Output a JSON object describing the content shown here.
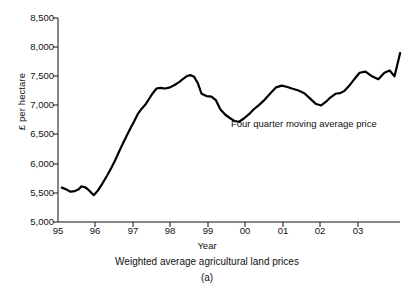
{
  "chart_data": {
    "type": "line",
    "title": "",
    "caption": "Weighted average agricultural land prices",
    "sub_caption": "(a)",
    "xlabel": "Year",
    "ylabel": "£ per hectare",
    "ylim": [
      5000,
      8500
    ],
    "ytick_values": [
      8500,
      8000,
      7500,
      7000,
      6500,
      6000,
      5500,
      5000
    ],
    "ytick_labels": [
      "8,500",
      "8,000",
      "7,500",
      "7,000",
      "6,500",
      "6,000",
      "5,500",
      "5,000"
    ],
    "xlim": [
      1995.0,
      1995.0
    ],
    "xtick_values": [
      1995,
      1996,
      1997,
      1998,
      1999,
      2000,
      2001,
      2002,
      2003
    ],
    "xtick_labels": [
      "95",
      "96",
      "97",
      "98",
      "99",
      "00",
      "01",
      "02",
      "03"
    ],
    "grid": false,
    "legend_position": "inline-annotation",
    "series": [
      {
        "name": "Four quarter moving average price",
        "color": "#000000",
        "line_width": 2.2,
        "annotation": "Four quarter moving average price",
        "x": [
          1995.1,
          1995.22,
          1995.33,
          1995.45,
          1995.55,
          1995.62,
          1995.7,
          1995.78,
          1995.86,
          1995.95,
          1996.05,
          1996.18,
          1996.3,
          1996.42,
          1996.52,
          1996.62,
          1996.72,
          1996.82,
          1996.92,
          1997.02,
          1997.12,
          1997.22,
          1997.32,
          1997.42,
          1997.52,
          1997.62,
          1997.72,
          1997.85,
          1997.98,
          1998.1,
          1998.22,
          1998.32,
          1998.42,
          1998.52,
          1998.62,
          1998.72,
          1998.82,
          1998.95,
          1999.08,
          1999.2,
          1999.32,
          1999.45,
          1999.58,
          1999.7,
          1999.82,
          1999.95,
          2000.08,
          2000.2,
          2000.35,
          2000.5,
          2000.65,
          2000.8,
          2000.95,
          2001.08,
          2001.22,
          2001.38,
          2001.55,
          2001.7,
          2001.85,
          2002.0,
          2002.12,
          2002.25,
          2002.38,
          2002.5,
          2002.62,
          2002.75,
          2002.88,
          2003.02,
          2003.18,
          2003.35,
          2003.52,
          2003.68,
          2003.82,
          2003.95
        ],
        "y": [
          5590,
          5560,
          5520,
          5530,
          5560,
          5610,
          5600,
          5570,
          5520,
          5460,
          5530,
          5660,
          5790,
          5930,
          6060,
          6200,
          6340,
          6470,
          6600,
          6720,
          6850,
          6940,
          7010,
          7110,
          7210,
          7290,
          7300,
          7290,
          7310,
          7350,
          7400,
          7450,
          7500,
          7520,
          7490,
          7380,
          7200,
          7160,
          7150,
          7090,
          6930,
          6840,
          6780,
          6730,
          6720,
          6780,
          6850,
          6930,
          7010,
          7100,
          7210,
          7310,
          7340,
          7320,
          7290,
          7260,
          7210,
          7120,
          7030,
          7000,
          7060,
          7140,
          7200,
          7210,
          7250,
          7340,
          7450,
          7560,
          7580,
          7500,
          7450,
          7560,
          7600,
          7500
        ],
        "start_value": 5590,
        "min_value": 5460,
        "max_value": 7900,
        "end_value": 7900
      }
    ]
  },
  "chart": {
    "annotation_text": "Four quarter moving average price",
    "axis": {
      "ylabel": "£ per hectare",
      "xlabel": "Year"
    },
    "caption": "Weighted average agricultural land prices",
    "sub_caption": "(a)",
    "yticks": [
      {
        "label": "8,500"
      },
      {
        "label": "8,000"
      },
      {
        "label": "7,500"
      },
      {
        "label": "7,000"
      },
      {
        "label": "6,500"
      },
      {
        "label": "6,000"
      },
      {
        "label": "5,500"
      },
      {
        "label": "5,000"
      }
    ],
    "xticks": [
      {
        "label": "95"
      },
      {
        "label": "96"
      },
      {
        "label": "97"
      },
      {
        "label": "98"
      },
      {
        "label": "99"
      },
      {
        "label": "00"
      },
      {
        "label": "01"
      },
      {
        "label": "02"
      },
      {
        "label": "03"
      }
    ]
  },
  "colors": {
    "line": "#000000",
    "axis": "#111111",
    "background": "#ffffff"
  }
}
